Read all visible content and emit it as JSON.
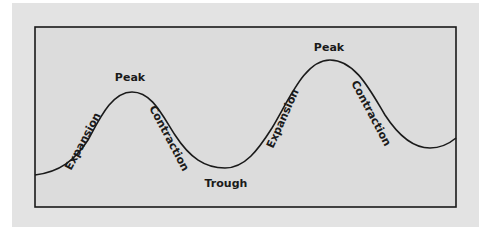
{
  "diagram": {
    "colors": {
      "page_background": "#ffffff",
      "panel_background": "#e3e3e3",
      "box_background": "#dcdcdc",
      "line": "#1a1a1a",
      "text": "#1a1a1a"
    },
    "labels": {
      "peak_1": "Peak",
      "expansion_1": "Expansion",
      "contraction_1": "Contraction",
      "trough": "Trough",
      "peak_2": "Peak",
      "expansion_2": "Expansion",
      "contraction_2": "Contraction"
    },
    "phases": [
      {
        "name": "Expansion",
        "segment": 1
      },
      {
        "name": "Peak",
        "segment": 1
      },
      {
        "name": "Contraction",
        "segment": 1
      },
      {
        "name": "Trough",
        "segment": 1
      },
      {
        "name": "Expansion",
        "segment": 2
      },
      {
        "name": "Peak",
        "segment": 2
      },
      {
        "name": "Contraction",
        "segment": 2
      }
    ]
  }
}
